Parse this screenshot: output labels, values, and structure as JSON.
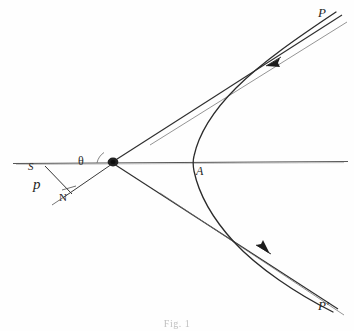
{
  "figure": {
    "caption": "Fig. 1",
    "background_color": "#fefefe",
    "ink_color": "#262626",
    "axis_color": "#4a4a4a"
  },
  "labels": {
    "asymptote_upper": "P",
    "asymptote_lower": "P'",
    "vertex": "A",
    "focus": "S",
    "impact_parameter": "p",
    "foot_of_perpendicular": "N",
    "deflection_angle": "θ"
  },
  "elements": {
    "axis_name": "principal-axis",
    "focus_name": "focus-point",
    "curve_name": "hyperbola-branch",
    "upper_asymptote_name": "upper-asymptote",
    "lower_asymptote_name": "lower-asymptote",
    "perpendicular_name": "impact-parameter-segment",
    "arrow_in_name": "incoming-direction-arrow",
    "arrow_out_name": "outgoing-direction-arrow"
  },
  "geometry": {
    "focus": [
      113,
      162
    ],
    "vertex": [
      193,
      163
    ],
    "axis_start": [
      13,
      163
    ],
    "axis_end": [
      348,
      161
    ],
    "upper_asymptote_end": [
      341,
      16
    ],
    "lower_asymptote_end": [
      337,
      310
    ],
    "perpendicular_from": [
      45,
      166
    ],
    "perpendicular_to": [
      72,
      194
    ],
    "arrow_in": [
      272,
      63
    ],
    "arrow_out": [
      262,
      249
    ]
  }
}
